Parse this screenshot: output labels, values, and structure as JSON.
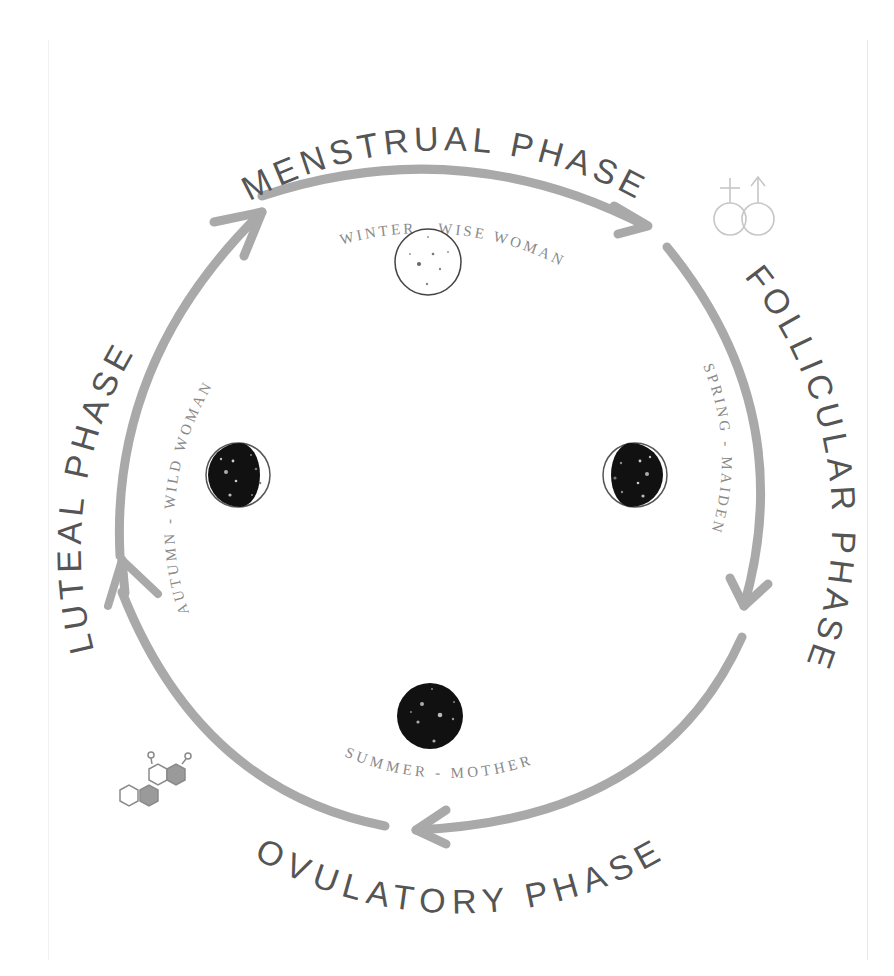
{
  "diagram": {
    "colors": {
      "arrow": "#a9a9a9",
      "outer_text": "#555555",
      "inner_text": "#8a8a8a",
      "moon_dark": "#111111",
      "icon_light": "#c8c8c8",
      "hex_fill": "#9a9a9a"
    },
    "phases": [
      {
        "name": "MENSTRUAL PHASE",
        "season": "WINTER - WISE WOMAN",
        "moon": "new-moon-outline",
        "position": "top"
      },
      {
        "name": "FOLLICULAR PHASE",
        "season": "SPRING - MAIDEN",
        "moon": "waxing-moon",
        "position": "right"
      },
      {
        "name": "OVULATORY PHASE",
        "season": "SUMMER - MOTHER",
        "moon": "full-moon-dark",
        "position": "bottom"
      },
      {
        "name": "LUTEAL PHASE",
        "season": "AUTUMN - WILD WOMAN",
        "moon": "waning-moon",
        "position": "left"
      }
    ],
    "icons": {
      "top_right": "male-female-symbols-icon",
      "bottom_left": "hormone-molecule-icon"
    }
  }
}
